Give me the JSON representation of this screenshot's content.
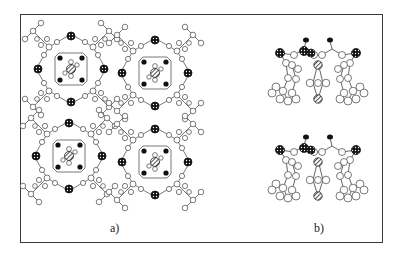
{
  "figure": {
    "panels": [
      {
        "id": "a",
        "label": "a)",
        "description": "Top view: 2x2 packing of four macrocyclic molecules, each with a hatched guest atom at the center"
      },
      {
        "id": "b",
        "label": "b)",
        "description": "Side view: two stacked molecules, each with a hatched guest atom inside the cavity"
      }
    ],
    "atom_styles": {
      "carbon": "open circle",
      "oxygen": "black filled circle",
      "metal": "dotted/checkered dark circle",
      "guest": "diagonal-hatched circle"
    },
    "colors": {
      "frame": "#3a3a3a",
      "bond": "#555555",
      "atom_fill": "#ffffff",
      "atom_stroke": "#444444",
      "dark_atom": "#111111"
    }
  }
}
